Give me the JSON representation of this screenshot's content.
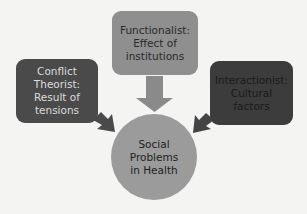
{
  "diagram": {
    "center": {
      "lines": [
        "Social",
        "Problems",
        "in Health"
      ],
      "color": "#9b9b9b"
    },
    "nodes": [
      {
        "id": "functionalist",
        "lines": [
          "Functionalist:",
          "Effect of",
          "institutions"
        ],
        "color": "#8f8f8f",
        "position": "top"
      },
      {
        "id": "conflict-theorist",
        "lines": [
          "Conflict",
          "Theorist:",
          "Result of",
          "tensions"
        ],
        "color": "#4a4a4a",
        "position": "left"
      },
      {
        "id": "interactionist",
        "lines": [
          "Interactionist:",
          "Cultural",
          "factors"
        ],
        "color": "#3c3c3c",
        "position": "right"
      }
    ],
    "arrows": [
      {
        "from": "functionalist",
        "to": "center",
        "color": "#8a8a8a"
      },
      {
        "from": "conflict-theorist",
        "to": "center",
        "color": "#4a4a4a"
      },
      {
        "from": "interactionist",
        "to": "center",
        "color": "#444444"
      }
    ]
  }
}
